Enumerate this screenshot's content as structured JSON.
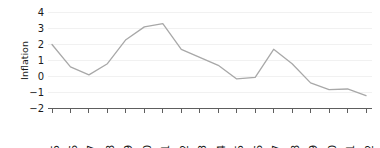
{
  "chart_data": {
    "type": "line",
    "title": "",
    "subtitle": "",
    "xlabel": "",
    "ylabel": "Inflation",
    "categories": [
      "1985",
      "1986",
      "1987",
      "1988",
      "1989",
      "1990",
      "1991",
      "1992",
      "1993",
      "1994",
      "1995",
      "1996",
      "1997",
      "1998",
      "1999",
      "2000",
      "2001",
      "2002"
    ],
    "x": [
      1985,
      1986,
      1987,
      1988,
      1989,
      1990,
      1991,
      1992,
      1993,
      1994,
      1995,
      1996,
      1997,
      1998,
      1999,
      2000,
      2001,
      2002
    ],
    "values": [
      2.0,
      0.6,
      0.1,
      0.8,
      2.3,
      3.1,
      3.3,
      1.7,
      1.2,
      0.7,
      -0.15,
      -0.05,
      1.7,
      0.8,
      -0.4,
      -0.82,
      -0.78,
      -1.2
    ],
    "series": [
      {
        "name": "Inflation",
        "color": "#a8a8a8",
        "values": [
          2.0,
          0.6,
          0.1,
          0.8,
          2.3,
          3.1,
          3.3,
          1.7,
          1.2,
          0.7,
          -0.15,
          -0.05,
          1.7,
          0.8,
          -0.4,
          -0.82,
          -0.78,
          -1.2
        ]
      }
    ],
    "ylim": [
      -2,
      4
    ],
    "xlim": [
      1985,
      2002
    ],
    "yticks": [
      4,
      3,
      2,
      1,
      0,
      -1,
      -2
    ],
    "ytick_labels": [
      "4",
      "3",
      "2",
      "1",
      "0",
      "−1",
      "−2"
    ],
    "grid": true,
    "grid_axis": "y",
    "grid_color": "#eeeeee",
    "legend": false,
    "legend_position": "none",
    "axis_color": "#4d4d4d",
    "background_color": "#ffffff",
    "xtick_rotation": 90
  }
}
